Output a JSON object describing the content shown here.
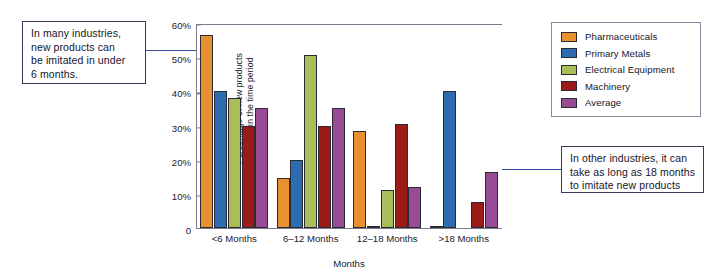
{
  "chart_data": {
    "type": "bar",
    "title": "",
    "xlabel": "Months",
    "ylabel": "Percentage of new products imitated in the time period",
    "ylabel_line1": "Percentage of new products",
    "ylabel_line2": "imitated in the time period",
    "categories": [
      "<6 Months",
      "6–12 Months",
      "12–18 Months",
      ">18 Months"
    ],
    "ylim": [
      0,
      60
    ],
    "ytick_labels": [
      "0",
      "10%",
      "20%",
      "30%",
      "40%",
      "50%",
      "60%"
    ],
    "ytick_values": [
      0,
      10,
      20,
      30,
      40,
      50,
      60
    ],
    "grid": false,
    "legend_position": "right",
    "series": [
      {
        "name": "Pharmaceuticals",
        "color": "#E8912E",
        "values": [
          56.5,
          14.5,
          28.5,
          0.6
        ]
      },
      {
        "name": "Primary Metals",
        "color": "#2E6CB0",
        "values": [
          40.0,
          20.0,
          0.6,
          40.0
        ]
      },
      {
        "name": "Electrical Equipment",
        "color": "#A9BD5B",
        "values": [
          38.0,
          50.5,
          11.0,
          0.0
        ]
      },
      {
        "name": "Machinery",
        "color": "#9C1B16",
        "values": [
          30.0,
          30.0,
          30.5,
          7.5
        ]
      },
      {
        "name": "Average",
        "color": "#994C96",
        "values": [
          35.0,
          35.0,
          12.0,
          16.5
        ]
      }
    ]
  },
  "annotations": {
    "left_callout": {
      "lines": [
        "In many industries,",
        "new products can",
        "be imitated in under",
        "6 months."
      ]
    },
    "right_callout": {
      "lines": [
        "In other industries, it can",
        "take as long as 18 months",
        "to imitate new products"
      ]
    }
  },
  "colors": {
    "arrow": "#3a4a9e",
    "axis": "#7b7b8c",
    "bar_outline": "#2a2a35",
    "text": "#15152b"
  }
}
